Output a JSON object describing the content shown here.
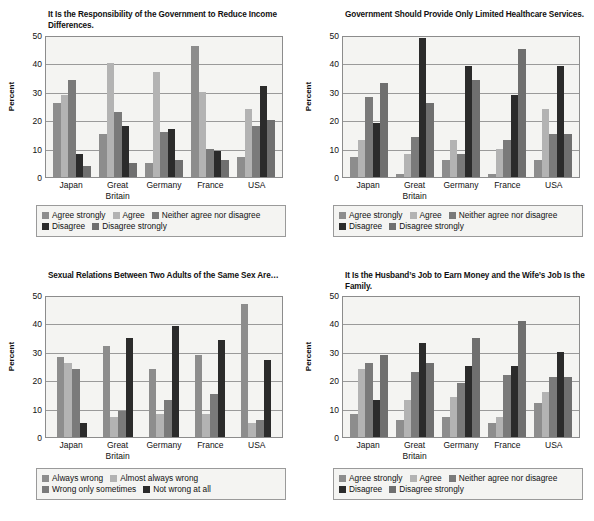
{
  "figure": {
    "y_axis_label": "Percent",
    "y_ticks": [
      0,
      10,
      20,
      30,
      40,
      50
    ],
    "countries": [
      "Japan",
      "Great Britain",
      "Germany",
      "France",
      "USA"
    ],
    "palette": {
      "agree_strongly": "#8d8d8d",
      "agree": "#b3b3b3",
      "neither": "#7a7a7a",
      "disagree": "#2b2b2b",
      "disagree_strongly": "#6f6f6f",
      "always_wrong": "#8d8d8d",
      "almost_always_wrong": "#b3b3b3",
      "wrong_only_sometimes": "#7a7a7a",
      "not_wrong_at_all": "#2b2b2b"
    }
  },
  "chart_data": [
    {
      "id": "income-differences",
      "type": "bar",
      "title": "It Is the Responsibility of the Government to Reduce Income Differences.",
      "xlabel": "",
      "ylabel": "Percent",
      "ylim": [
        0,
        50
      ],
      "yticks": [
        0,
        10,
        20,
        30,
        40,
        50
      ],
      "grid": true,
      "legend_position": "bottom",
      "categories": [
        "Japan",
        "Great Britain",
        "Germany",
        "France",
        "USA"
      ],
      "series": [
        {
          "name": "Agree strongly",
          "color": "#8d8d8d",
          "values": [
            26,
            15,
            5,
            46,
            7
          ]
        },
        {
          "name": "Agree",
          "color": "#b3b3b3",
          "values": [
            29,
            40,
            37,
            30,
            24
          ]
        },
        {
          "name": "Neither agree nor disagree",
          "color": "#7a7a7a",
          "values": [
            34,
            23,
            16,
            10,
            18
          ]
        },
        {
          "name": "Disagree",
          "color": "#2b2b2b",
          "values": [
            8,
            18,
            17,
            9,
            32
          ]
        },
        {
          "name": "Disagree strongly",
          "color": "#6f6f6f",
          "values": [
            4,
            5,
            6,
            6,
            20
          ]
        }
      ]
    },
    {
      "id": "limited-healthcare",
      "type": "bar",
      "title": "Government Should Provide Only Limited Healthcare Services.",
      "xlabel": "",
      "ylabel": "Percent",
      "ylim": [
        0,
        50
      ],
      "yticks": [
        0,
        10,
        20,
        30,
        40,
        50
      ],
      "grid": true,
      "legend_position": "bottom",
      "categories": [
        "Japan",
        "Great Britain",
        "Germany",
        "France",
        "USA"
      ],
      "series": [
        {
          "name": "Agree strongly",
          "color": "#8d8d8d",
          "values": [
            7,
            1,
            6,
            1,
            6
          ]
        },
        {
          "name": "Agree",
          "color": "#b3b3b3",
          "values": [
            13,
            8,
            13,
            10,
            24
          ]
        },
        {
          "name": "Neither agree nor disagree",
          "color": "#7a7a7a",
          "values": [
            28,
            14,
            8,
            13,
            15
          ]
        },
        {
          "name": "Disagree",
          "color": "#2b2b2b",
          "values": [
            19,
            49,
            39,
            29,
            39
          ]
        },
        {
          "name": "Disagree strongly",
          "color": "#6f6f6f",
          "values": [
            33,
            26,
            34,
            45,
            15
          ]
        }
      ]
    },
    {
      "id": "sexual-relations-same-sex",
      "type": "bar",
      "title": "Sexual Relations Between Two Adults of the Same Sex Are…",
      "xlabel": "",
      "ylabel": "Percent",
      "ylim": [
        0,
        50
      ],
      "yticks": [
        0,
        10,
        20,
        30,
        40,
        50
      ],
      "grid": true,
      "legend_position": "bottom",
      "categories": [
        "Japan",
        "Great Britain",
        "Germany",
        "France",
        "USA"
      ],
      "series": [
        {
          "name": "Always wrong",
          "color": "#8d8d8d",
          "values": [
            28,
            32,
            24,
            29,
            47
          ]
        },
        {
          "name": "Almost always wrong",
          "color": "#b3b3b3",
          "values": [
            26,
            7,
            8,
            8,
            5
          ]
        },
        {
          "name": "Wrong only sometimes",
          "color": "#7a7a7a",
          "values": [
            24,
            9,
            13,
            15,
            6
          ]
        },
        {
          "name": "Not wrong at all",
          "color": "#2b2b2b",
          "values": [
            5,
            35,
            39,
            34,
            27
          ]
        }
      ]
    },
    {
      "id": "husband-job-wife-family",
      "type": "bar",
      "title": "It Is the Husband’s Job to Earn Money and the Wife’s Job Is the Family.",
      "xlabel": "",
      "ylabel": "Percent",
      "ylim": [
        0,
        50
      ],
      "yticks": [
        0,
        10,
        20,
        30,
        40,
        50
      ],
      "grid": true,
      "legend_position": "bottom",
      "categories": [
        "Japan",
        "Great Britain",
        "Germany",
        "France",
        "USA"
      ],
      "series": [
        {
          "name": "Agree strongly",
          "color": "#8d8d8d",
          "values": [
            8,
            6,
            7,
            5,
            12
          ]
        },
        {
          "name": "Agree",
          "color": "#b3b3b3",
          "values": [
            24,
            13,
            14,
            7,
            16
          ]
        },
        {
          "name": "Neither agree nor disagree",
          "color": "#7a7a7a",
          "values": [
            26,
            23,
            19,
            22,
            21
          ]
        },
        {
          "name": "Disagree",
          "color": "#2b2b2b",
          "values": [
            13,
            33,
            25,
            25,
            30
          ]
        },
        {
          "name": "Disagree strongly",
          "color": "#6f6f6f",
          "values": [
            29,
            26,
            35,
            41,
            21
          ]
        }
      ]
    }
  ]
}
